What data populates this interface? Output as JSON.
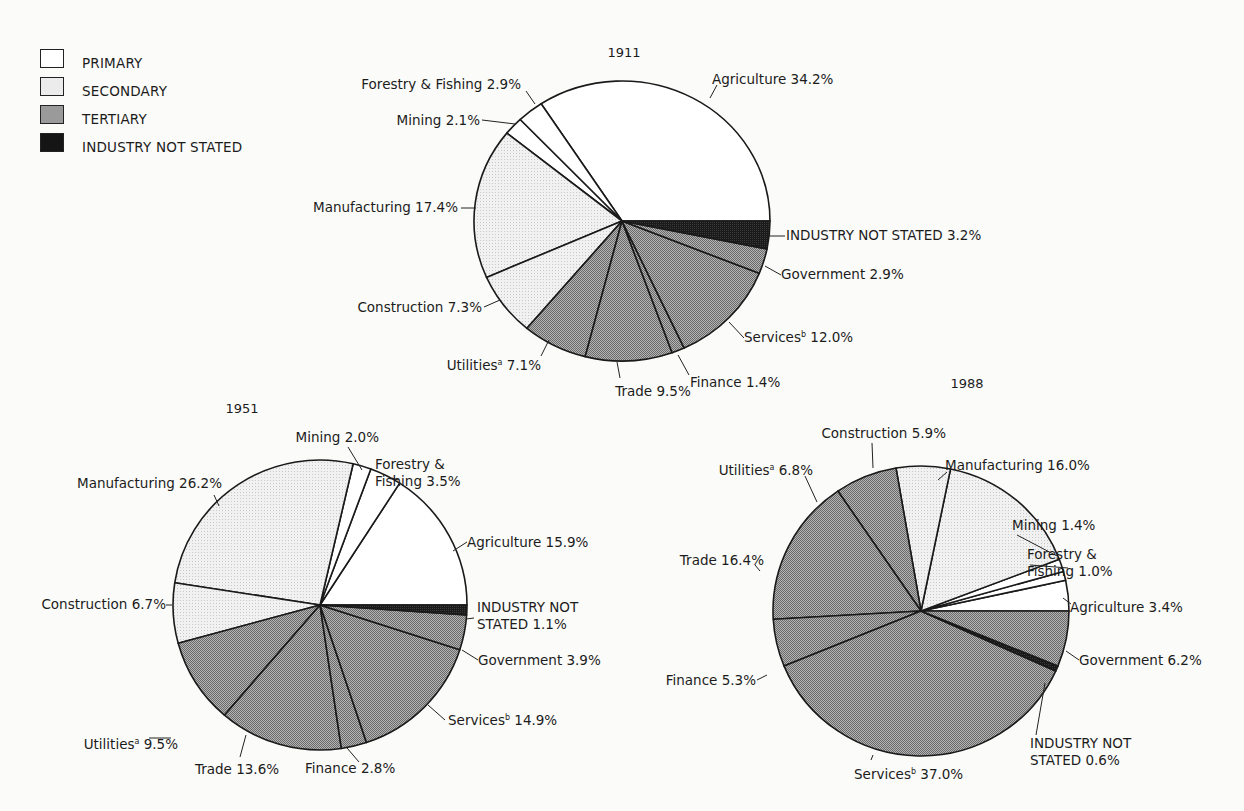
{
  "legend": {
    "items": [
      {
        "label": "PRIMARY",
        "key": "primary"
      },
      {
        "label": "SECONDARY",
        "key": "secondary"
      },
      {
        "label": "TERTIARY",
        "key": "tertiary"
      },
      {
        "label": "INDUSTRY NOT STATED",
        "key": "not_stated"
      }
    ]
  },
  "colors": {
    "primary": "#ffffff",
    "secondary": "#ececec",
    "tertiary": "#9a9a9a",
    "not_stated": "#151515",
    "outline": "#1a1a1a"
  },
  "chart_data": [
    {
      "type": "pie",
      "title": "1911",
      "slices": [
        {
          "label": "Agriculture",
          "value": 34.2,
          "group": "primary"
        },
        {
          "label": "Forestry & Fishing",
          "value": 2.9,
          "group": "primary"
        },
        {
          "label": "Mining",
          "value": 2.1,
          "group": "primary"
        },
        {
          "label": "Manufacturing",
          "value": 17.4,
          "group": "secondary"
        },
        {
          "label": "Construction",
          "value": 7.3,
          "group": "secondary"
        },
        {
          "label": "Utilities",
          "superscript": "a",
          "value": 7.1,
          "group": "tertiary"
        },
        {
          "label": "Trade",
          "value": 9.5,
          "group": "tertiary"
        },
        {
          "label": "Finance",
          "value": 1.4,
          "group": "tertiary"
        },
        {
          "label": "Services",
          "superscript": "b",
          "value": 12.0,
          "group": "tertiary"
        },
        {
          "label": "Government",
          "value": 2.9,
          "group": "tertiary"
        },
        {
          "label": "INDUSTRY NOT STATED",
          "value": 3.2,
          "group": "not_stated"
        }
      ]
    },
    {
      "type": "pie",
      "title": "1951",
      "slices": [
        {
          "label": "Agriculture",
          "value": 15.9,
          "group": "primary"
        },
        {
          "label": "Forestry & Fishing",
          "value": 3.5,
          "group": "primary"
        },
        {
          "label": "Mining",
          "value": 2.0,
          "group": "primary"
        },
        {
          "label": "Manufacturing",
          "value": 26.2,
          "group": "secondary"
        },
        {
          "label": "Construction",
          "value": 6.7,
          "group": "secondary"
        },
        {
          "label": "Utilities",
          "superscript": "a",
          "value": 9.5,
          "group": "tertiary"
        },
        {
          "label": "Trade",
          "value": 13.6,
          "group": "tertiary"
        },
        {
          "label": "Finance",
          "value": 2.8,
          "group": "tertiary"
        },
        {
          "label": "Services",
          "superscript": "b",
          "value": 14.9,
          "group": "tertiary"
        },
        {
          "label": "Government",
          "value": 3.9,
          "group": "tertiary"
        },
        {
          "label": "INDUSTRY NOT STATED",
          "value": 1.1,
          "group": "not_stated"
        }
      ]
    },
    {
      "type": "pie",
      "title": "1988",
      "slices": [
        {
          "label": "Agriculture",
          "value": 3.4,
          "group": "primary"
        },
        {
          "label": "Forestry & Fishing",
          "value": 1.0,
          "group": "primary"
        },
        {
          "label": "Mining",
          "value": 1.4,
          "group": "primary"
        },
        {
          "label": "Manufacturing",
          "value": 16.0,
          "group": "secondary"
        },
        {
          "label": "Construction",
          "value": 5.9,
          "group": "secondary"
        },
        {
          "label": "Utilities",
          "superscript": "a",
          "value": 6.8,
          "group": "tertiary"
        },
        {
          "label": "Trade",
          "value": 16.4,
          "group": "tertiary"
        },
        {
          "label": "Finance",
          "value": 5.3,
          "group": "tertiary"
        },
        {
          "label": "Services",
          "superscript": "b",
          "value": 37.0,
          "group": "tertiary"
        },
        {
          "label": "INDUSTRY NOT STATED",
          "value": 0.6,
          "group": "not_stated"
        },
        {
          "label": "Government",
          "value": 6.2,
          "group": "tertiary"
        }
      ]
    }
  ]
}
